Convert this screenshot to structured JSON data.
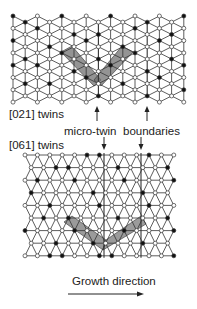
{
  "figure": {
    "labels": {
      "top_panel": "[021] twins",
      "bottom_panel": "[061] twins",
      "micro_twin": "micro-twin",
      "boundaries": "boundaries",
      "growth": "Growth direction"
    },
    "colors": {
      "line": "#333333",
      "node_filled": "#111111",
      "node_open": "#ffffff",
      "twin_band": "#707070"
    },
    "top_lattice": {
      "orientation": "vertical-columns",
      "columns": 15,
      "rows": 8,
      "twin_shape": "V",
      "filled_nodes": [
        [
          0,
          0
        ],
        [
          1,
          0
        ],
        [
          0,
          2
        ],
        [
          1,
          3
        ],
        [
          0,
          4
        ],
        [
          1,
          5
        ],
        [
          2,
          1
        ],
        [
          3,
          2
        ],
        [
          2,
          4
        ],
        [
          3,
          5
        ],
        [
          4,
          0
        ],
        [
          4,
          3
        ],
        [
          5,
          1
        ],
        [
          5,
          4
        ],
        [
          6,
          2
        ],
        [
          6,
          5
        ],
        [
          7,
          1
        ],
        [
          7,
          3
        ],
        [
          7,
          6
        ],
        [
          8,
          0
        ],
        [
          8,
          4
        ],
        [
          9,
          2
        ],
        [
          9,
          5
        ],
        [
          10,
          1
        ],
        [
          10,
          3
        ],
        [
          11,
          0
        ],
        [
          11,
          4
        ],
        [
          11,
          6
        ],
        [
          12,
          2
        ],
        [
          12,
          5
        ],
        [
          13,
          1
        ],
        [
          13,
          3
        ],
        [
          14,
          0
        ],
        [
          14,
          4
        ],
        [
          14,
          6
        ],
        [
          3,
          7
        ],
        [
          9,
          7
        ]
      ]
    },
    "bottom_lattice": {
      "orientation": "horizontal-rows",
      "columns": 13,
      "rows": 9,
      "twin_shape": "V",
      "boundary_columns": 2,
      "filled_nodes": [
        [
          0,
          5
        ],
        [
          0,
          6
        ],
        [
          0,
          10
        ],
        [
          1,
          2
        ],
        [
          1,
          3
        ],
        [
          1,
          7
        ],
        [
          1,
          11
        ],
        [
          2,
          1
        ],
        [
          2,
          4
        ],
        [
          2,
          8
        ],
        [
          2,
          12
        ],
        [
          3,
          0
        ],
        [
          3,
          5
        ],
        [
          3,
          9
        ],
        [
          4,
          2
        ],
        [
          4,
          6
        ],
        [
          4,
          10
        ],
        [
          5,
          1
        ],
        [
          5,
          3
        ],
        [
          5,
          7
        ],
        [
          5,
          11
        ],
        [
          6,
          0
        ],
        [
          6,
          4
        ],
        [
          6,
          8
        ],
        [
          6,
          12
        ],
        [
          7,
          2
        ],
        [
          7,
          5
        ],
        [
          7,
          9
        ],
        [
          8,
          2
        ],
        [
          8,
          3
        ],
        [
          8,
          6
        ],
        [
          8,
          7
        ],
        [
          8,
          12
        ]
      ]
    }
  }
}
